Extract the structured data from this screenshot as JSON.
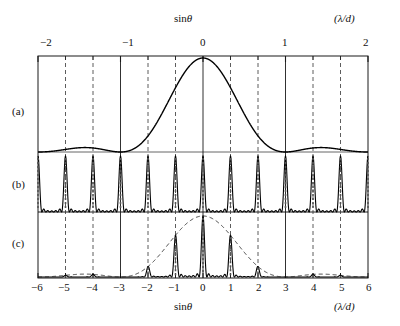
{
  "figure": {
    "top_axis": {
      "name": "sinθ",
      "units": "(λ/d)",
      "ticks": [
        -2,
        -1,
        0,
        1,
        2
      ],
      "tick_labels": [
        "−2",
        "−1",
        "0",
        "1",
        "2"
      ],
      "minor_per_unit": 3
    },
    "bottom_axis": {
      "name": "sinθ",
      "units": "(λ/d)",
      "ticks": [
        -6,
        -5,
        -4,
        -3,
        -2,
        -1,
        0,
        1,
        2,
        3,
        4,
        5,
        6
      ],
      "tick_labels": [
        "−6",
        "−5",
        "−4",
        "−3",
        "−2",
        "−1",
        "0",
        "1",
        "2",
        "3",
        "4",
        "5",
        "6"
      ]
    },
    "panels": [
      {
        "id": "a",
        "label": "(a)",
        "caption": "single-slit diffraction envelope"
      },
      {
        "id": "b",
        "label": "(b)",
        "caption": "multiple-slit interference"
      },
      {
        "id": "c",
        "label": "(c)",
        "caption": "combined diffraction grating pattern"
      }
    ],
    "colors": {
      "ink": "#1a1a1a",
      "curve": "#000000",
      "dashed_grid": "#333333",
      "envelope_dashed": "#222222",
      "background": "#ffffff"
    }
  },
  "chart_data": {
    "type": "line",
    "title": "",
    "xlabel": "sinθ",
    "ylabel": "",
    "xlim": [
      -6,
      6
    ],
    "ylim": [
      0,
      1
    ],
    "grid": true,
    "legend": "none",
    "annotations": [
      "(a)",
      "(b)",
      "(c)",
      "sinθ",
      "(λ/d)"
    ],
    "panel_a": {
      "name": "Single-slit diffraction envelope",
      "function": "sinc^2(pi*x/3)",
      "first_zero_at": [
        -3,
        3
      ],
      "peak_x": 0,
      "peak_value": 1.0,
      "secondary_peaks_x": [
        -4.5,
        4.5
      ],
      "secondary_peak_value": 0.045,
      "x_sample": [
        -6,
        -5.5,
        -5,
        -4.5,
        -4,
        -3.5,
        -3,
        -2.5,
        -2,
        -1.5,
        -1,
        -0.5,
        0,
        0.5,
        1,
        1.5,
        2,
        2.5,
        3,
        3.5,
        4,
        4.5,
        5,
        5.5,
        6
      ],
      "y_sample": [
        0.0,
        0.013,
        0.024,
        0.045,
        0.024,
        0.0,
        0.0,
        0.056,
        0.19,
        0.405,
        0.684,
        0.913,
        1.0,
        0.913,
        0.684,
        0.405,
        0.19,
        0.056,
        0.0,
        0.0,
        0.024,
        0.045,
        0.024,
        0.013,
        0.0
      ]
    },
    "panel_b": {
      "name": "Multiple-slit interference factor",
      "principal_maxima_x": [
        -6,
        -5,
        -4,
        -3,
        -2,
        -1,
        0,
        1,
        2,
        3,
        4,
        5,
        6
      ],
      "principal_maxima_value": 1.0,
      "subsidiary_maxima_per_order": 5,
      "subsidiary_max_value": 0.045,
      "slit_count": 7
    },
    "panel_c": {
      "name": "Resultant grating intensity (a × b)",
      "orders_x": [
        -6,
        -5,
        -4,
        -3,
        -2,
        -1,
        0,
        1,
        2,
        3,
        4,
        5,
        6
      ],
      "orders_value": [
        0.0,
        0.024,
        0.024,
        0.0,
        0.19,
        0.684,
        1.0,
        0.684,
        0.19,
        0.0,
        0.024,
        0.024,
        0.0
      ],
      "envelope": "dashed sinc^2 curve from panel (a)",
      "missing_orders_x": [
        -6,
        -3,
        3,
        6
      ]
    }
  }
}
